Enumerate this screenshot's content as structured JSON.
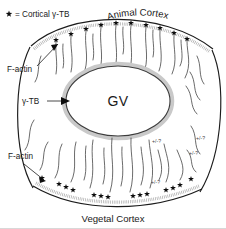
{
  "figure": {
    "legend": {
      "symbol": "star",
      "text": "= Cortical γ-TB"
    },
    "labels": {
      "animal_cortex": "Animal Cortex",
      "vegetal_cortex": "Vegetal Cortex",
      "nucleus": "GV",
      "gamma_tb": "γ-TB",
      "f_actin_top": "F-actin",
      "f_actin_bottom": "F-actin"
    },
    "annotations": [
      {
        "text": "+/-?",
        "x": 152,
        "y": 143
      },
      {
        "text": "+/-?",
        "x": 196,
        "y": 140
      },
      {
        "text": "+/-?",
        "x": 189,
        "y": 155
      },
      {
        "text": "+/-?",
        "x": 151,
        "y": 184
      }
    ],
    "colors": {
      "background": "#ffffff",
      "ink": "#1a1a1a",
      "star": "#0d0d0d",
      "cortex_band": "#9a9a9a",
      "gv_halo": "#c9c9c9"
    },
    "animal_cortex_stars": [
      {
        "x": 56,
        "y": 40
      },
      {
        "x": 71,
        "y": 34
      },
      {
        "x": 86,
        "y": 29
      },
      {
        "x": 101,
        "y": 25
      },
      {
        "x": 116,
        "y": 23
      },
      {
        "x": 131,
        "y": 23
      },
      {
        "x": 146,
        "y": 25
      },
      {
        "x": 160,
        "y": 28
      },
      {
        "x": 174,
        "y": 33
      },
      {
        "x": 187,
        "y": 39
      }
    ],
    "vegetal_cortex_stars": [
      {
        "x": 42,
        "y": 178
      },
      {
        "x": 59,
        "y": 184
      },
      {
        "x": 66,
        "y": 187
      },
      {
        "x": 73,
        "y": 190
      },
      {
        "x": 94,
        "y": 195
      },
      {
        "x": 101,
        "y": 196
      },
      {
        "x": 108,
        "y": 197
      },
      {
        "x": 133,
        "y": 196
      },
      {
        "x": 140,
        "y": 195
      },
      {
        "x": 147,
        "y": 194
      },
      {
        "x": 166,
        "y": 190
      },
      {
        "x": 173,
        "y": 188
      },
      {
        "x": 180,
        "y": 185
      },
      {
        "x": 191,
        "y": 179
      }
    ]
  }
}
